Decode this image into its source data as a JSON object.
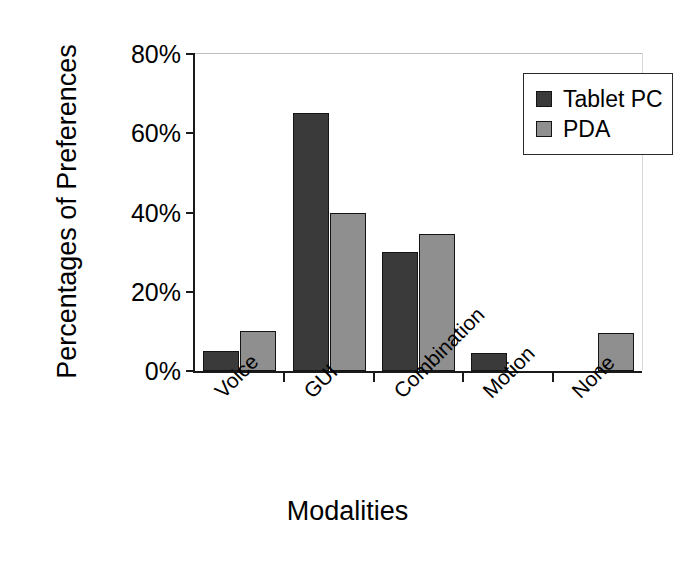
{
  "chart_data": {
    "type": "bar",
    "title": "",
    "xlabel": "Modalities",
    "ylabel": "Percentages of Preferences",
    "categories": [
      "Voice",
      "GUI",
      "Combination",
      "Motion",
      "None"
    ],
    "series": [
      {
        "name": "Tablet PC",
        "color": "#3a3a3a",
        "values": [
          5,
          65,
          30,
          4.5,
          0
        ]
      },
      {
        "name": "PDA",
        "color": "#8f8f8f",
        "values": [
          10,
          40,
          34.5,
          0,
          9.5
        ]
      }
    ],
    "ylim": [
      0,
      80
    ],
    "yticks": [
      0,
      20,
      40,
      60,
      80
    ],
    "ytick_labels": [
      "0%",
      "20%",
      "40%",
      "60%",
      "80%"
    ],
    "grid": false,
    "legend_position": "top-right",
    "xtick_label_rotation": -45
  },
  "legend": {
    "items": [
      {
        "label": "Tablet PC",
        "color": "#3a3a3a"
      },
      {
        "label": "PDA",
        "color": "#8f8f8f"
      }
    ]
  }
}
